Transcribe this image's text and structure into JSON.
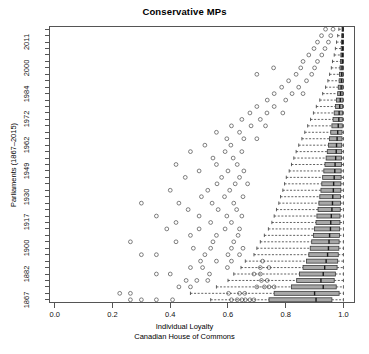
{
  "chart_data": {
    "type": "box",
    "title": "Conservative MPs",
    "xlabel": "Individual Loyalty",
    "xlabel_sub": "Canadian House of Commons",
    "ylabel": "Parliaments (1867–2015)",
    "xlim": [
      -0.02,
      1.04
    ],
    "xticks": [
      0.0,
      0.2,
      0.4,
      0.6,
      0.8,
      1.0
    ],
    "xticklabels": [
      "0.0",
      "0.2",
      "0.4",
      "0.6",
      "0.8",
      "1.0"
    ],
    "yticklabels": [
      "1867",
      "1882",
      "1900",
      "1917",
      "1930",
      "1949",
      "1962",
      "1972",
      "1984",
      "2000",
      "2011"
    ],
    "ytick_rows": [
      1,
      5,
      9,
      13,
      17,
      21,
      25,
      29,
      33,
      37,
      41
    ],
    "n_rows": 43,
    "grid": false,
    "legend": false,
    "orientation": "horizontal",
    "box_fill": "#a8a8a8",
    "box_stroke": "#3a3a3a",
    "median_color": "#1a1a1a",
    "whisker_style": "dashed",
    "outlier_marker": "open-circle",
    "boxes": [
      {
        "row": 1,
        "low": 0.54,
        "q1": 0.742,
        "med": 0.905,
        "q3": 0.96,
        "high": 1.0,
        "out": [
          0.262,
          0.3,
          0.352,
          0.408,
          0.612,
          0.632,
          0.648,
          0.66,
          0.676,
          0.69
        ]
      },
      {
        "row": 2,
        "low": 0.47,
        "q1": 0.76,
        "med": 0.9,
        "q3": 0.985,
        "high": 1.0,
        "out": [
          0.225,
          0.262,
          0.602,
          0.64,
          0.658
        ]
      },
      {
        "row": 3,
        "low": 0.56,
        "q1": 0.82,
        "med": 0.93,
        "q3": 0.975,
        "high": 1.0,
        "out": [
          0.43,
          0.47,
          0.7,
          0.726,
          0.742,
          0.76
        ]
      },
      {
        "row": 4,
        "low": 0.6,
        "q1": 0.838,
        "med": 0.922,
        "q3": 0.968,
        "high": 1.0,
        "out": [
          0.455,
          0.492,
          0.53,
          0.716,
          0.736
        ]
      },
      {
        "row": 5,
        "low": 0.62,
        "q1": 0.848,
        "med": 0.93,
        "q3": 0.972,
        "high": 1.0,
        "out": [
          0.352,
          0.4,
          0.536,
          0.69,
          0.712
        ]
      },
      {
        "row": 6,
        "low": 0.645,
        "q1": 0.86,
        "med": 0.935,
        "q3": 0.978,
        "high": 1.0,
        "out": [
          0.47,
          0.512,
          0.598,
          0.712,
          0.742
        ]
      },
      {
        "row": 7,
        "low": 0.66,
        "q1": 0.872,
        "med": 0.94,
        "q3": 0.98,
        "high": 1.0,
        "out": [
          0.505,
          0.56,
          0.612,
          0.72
        ]
      },
      {
        "row": 8,
        "low": 0.69,
        "q1": 0.88,
        "med": 0.945,
        "q3": 0.982,
        "high": 1.0,
        "out": [
          0.3,
          0.352,
          0.52,
          0.6,
          0.64
        ]
      },
      {
        "row": 9,
        "low": 0.7,
        "q1": 0.885,
        "med": 0.948,
        "q3": 0.984,
        "high": 1.0,
        "out": [
          0.48,
          0.54,
          0.612,
          0.652
        ]
      },
      {
        "row": 10,
        "low": 0.712,
        "q1": 0.89,
        "med": 0.95,
        "q3": 0.985,
        "high": 1.0,
        "out": [
          0.262,
          0.42,
          0.548,
          0.62
        ]
      },
      {
        "row": 11,
        "low": 0.726,
        "q1": 0.896,
        "med": 0.952,
        "q3": 0.986,
        "high": 1.0,
        "out": [
          0.47,
          0.56,
          0.635
        ]
      },
      {
        "row": 12,
        "low": 0.74,
        "q1": 0.9,
        "med": 0.955,
        "q3": 0.987,
        "high": 1.0,
        "out": [
          0.388,
          0.5,
          0.59,
          0.64
        ]
      },
      {
        "row": 13,
        "low": 0.752,
        "q1": 0.905,
        "med": 0.956,
        "q3": 0.988,
        "high": 1.0,
        "out": [
          0.42,
          0.54,
          0.612
        ]
      },
      {
        "row": 14,
        "low": 0.76,
        "q1": 0.908,
        "med": 0.958,
        "q3": 0.988,
        "high": 1.0,
        "out": [
          0.352,
          0.5,
          0.596,
          0.648
        ]
      },
      {
        "row": 15,
        "low": 0.768,
        "q1": 0.912,
        "med": 0.96,
        "q3": 0.989,
        "high": 1.0,
        "out": [
          0.462,
          0.566,
          0.63
        ]
      },
      {
        "row": 16,
        "low": 0.776,
        "q1": 0.915,
        "med": 0.962,
        "q3": 0.99,
        "high": 1.0,
        "out": [
          0.3,
          0.43,
          0.545,
          0.62
        ]
      },
      {
        "row": 17,
        "low": 0.782,
        "q1": 0.918,
        "med": 0.963,
        "q3": 0.99,
        "high": 1.0,
        "out": [
          0.508,
          0.588,
          0.652
        ]
      },
      {
        "row": 18,
        "low": 0.79,
        "q1": 0.922,
        "med": 0.965,
        "q3": 0.991,
        "high": 1.0,
        "out": [
          0.4,
          0.53,
          0.606
        ]
      },
      {
        "row": 19,
        "low": 0.796,
        "q1": 0.925,
        "med": 0.966,
        "q3": 0.991,
        "high": 1.0,
        "out": [
          0.562,
          0.625,
          0.668
        ]
      },
      {
        "row": 20,
        "low": 0.802,
        "q1": 0.928,
        "med": 0.968,
        "q3": 0.992,
        "high": 1.0,
        "out": [
          0.452,
          0.578,
          0.64
        ]
      },
      {
        "row": 21,
        "low": 0.812,
        "q1": 0.932,
        "med": 0.97,
        "q3": 0.992,
        "high": 1.0,
        "out": [
          0.5,
          0.6,
          0.655
        ]
      },
      {
        "row": 22,
        "low": 0.82,
        "q1": 0.936,
        "med": 0.971,
        "q3": 0.993,
        "high": 1.0,
        "out": [
          0.42,
          0.56,
          0.632
        ]
      },
      {
        "row": 23,
        "low": 0.828,
        "q1": 0.94,
        "med": 0.973,
        "q3": 0.993,
        "high": 1.0,
        "out": [
          0.548,
          0.618
        ]
      },
      {
        "row": 24,
        "low": 0.836,
        "q1": 0.944,
        "med": 0.975,
        "q3": 0.994,
        "high": 1.0,
        "out": [
          0.47,
          0.59,
          0.648
        ]
      },
      {
        "row": 25,
        "low": 0.845,
        "q1": 0.948,
        "med": 0.976,
        "q3": 0.994,
        "high": 1.0,
        "out": [
          0.52,
          0.61
        ]
      },
      {
        "row": 26,
        "low": 0.856,
        "q1": 0.952,
        "med": 0.978,
        "q3": 0.995,
        "high": 1.0,
        "out": [
          0.596,
          0.655,
          0.7
        ]
      },
      {
        "row": 27,
        "low": 0.866,
        "q1": 0.956,
        "med": 0.98,
        "q3": 0.995,
        "high": 1.0,
        "out": [
          0.56,
          0.64
        ]
      },
      {
        "row": 28,
        "low": 0.876,
        "q1": 0.96,
        "med": 0.982,
        "q3": 0.996,
        "high": 1.0,
        "out": [
          0.612,
          0.68,
          0.73
        ]
      },
      {
        "row": 29,
        "low": 0.886,
        "q1": 0.964,
        "med": 0.984,
        "q3": 0.996,
        "high": 1.0,
        "out": [
          0.648,
          0.712
        ]
      },
      {
        "row": 30,
        "low": 0.896,
        "q1": 0.968,
        "med": 0.985,
        "q3": 0.997,
        "high": 1.0,
        "out": [
          0.676,
          0.735,
          0.79
        ]
      },
      {
        "row": 31,
        "low": 0.906,
        "q1": 0.972,
        "med": 0.987,
        "q3": 0.997,
        "high": 1.0,
        "out": [
          0.7,
          0.76
        ]
      },
      {
        "row": 32,
        "low": 0.918,
        "q1": 0.976,
        "med": 0.989,
        "q3": 0.998,
        "high": 1.0,
        "out": [
          0.736,
          0.8
        ]
      },
      {
        "row": 33,
        "low": 0.928,
        "q1": 0.98,
        "med": 0.99,
        "q3": 0.998,
        "high": 1.0,
        "out": [
          0.76,
          0.822,
          0.86
        ]
      },
      {
        "row": 34,
        "low": 0.938,
        "q1": 0.982,
        "med": 0.992,
        "q3": 0.998,
        "high": 1.0,
        "out": [
          0.786,
          0.845
        ]
      },
      {
        "row": 35,
        "low": 0.946,
        "q1": 0.985,
        "med": 0.993,
        "q3": 0.999,
        "high": 1.0,
        "out": [
          0.81,
          0.872
        ]
      },
      {
        "row": 36,
        "low": 0.952,
        "q1": 0.986,
        "med": 0.994,
        "q3": 0.999,
        "high": 1.0,
        "out": [
          0.7,
          0.836,
          0.89
        ]
      },
      {
        "row": 37,
        "low": 0.958,
        "q1": 0.988,
        "med": 0.995,
        "q3": 0.999,
        "high": 1.0,
        "out": [
          0.758,
          0.852,
          0.9
        ]
      },
      {
        "row": 38,
        "low": 0.962,
        "q1": 0.99,
        "med": 0.996,
        "q3": 0.999,
        "high": 1.0,
        "out": [
          0.86,
          0.91
        ]
      },
      {
        "row": 39,
        "low": 0.968,
        "q1": 0.991,
        "med": 0.996,
        "q3": 1.0,
        "high": 1.0,
        "out": [
          0.88,
          0.925
        ]
      },
      {
        "row": 40,
        "low": 0.972,
        "q1": 0.992,
        "med": 0.997,
        "q3": 1.0,
        "high": 1.0,
        "out": [
          0.898,
          0.936
        ]
      },
      {
        "row": 41,
        "low": 0.976,
        "q1": 0.993,
        "med": 0.997,
        "q3": 1.0,
        "high": 1.0,
        "out": [
          0.91,
          0.948
        ]
      },
      {
        "row": 42,
        "low": 0.98,
        "q1": 0.994,
        "med": 0.998,
        "q3": 1.0,
        "high": 1.0,
        "out": [
          0.924,
          0.956
        ]
      },
      {
        "row": 43,
        "low": 0.984,
        "q1": 0.995,
        "med": 0.998,
        "q3": 1.0,
        "high": 1.0,
        "out": [
          0.938,
          0.964
        ]
      }
    ]
  }
}
